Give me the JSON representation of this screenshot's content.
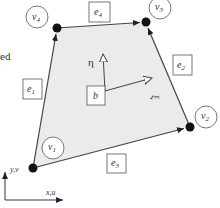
{
  "diagram": {
    "partial_text": "ed",
    "vertices": [
      {
        "id": "v1",
        "label": "v",
        "sub": "1"
      },
      {
        "id": "v2",
        "label": "v",
        "sub": "2"
      },
      {
        "id": "v3",
        "label": "v",
        "sub": "3"
      },
      {
        "id": "v4",
        "label": "v",
        "sub": "4"
      }
    ],
    "edges": [
      {
        "id": "e1",
        "label": "e",
        "sub": "1"
      },
      {
        "id": "e2",
        "label": "e",
        "sub": "2"
      },
      {
        "id": "e3",
        "label": "e",
        "sub": "3"
      },
      {
        "id": "e4",
        "label": "e",
        "sub": "4"
      }
    ],
    "center_label": "b",
    "local_axes": {
      "eta": "η",
      "xi": "ξ"
    },
    "global_axes": {
      "y": "y,v",
      "x": "x,u"
    },
    "colors": {
      "fill": "#ebebeb",
      "line": "#444444",
      "node": "#111111"
    }
  }
}
